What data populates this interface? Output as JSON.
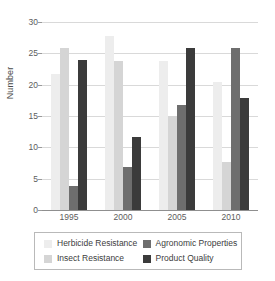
{
  "chart_data": {
    "type": "bar",
    "title": "",
    "subtitle": "",
    "xlabel": "",
    "ylabel": "Number",
    "categories": [
      "1995",
      "2000",
      "2005",
      "2010"
    ],
    "series": [
      {
        "name": "Herbicide Resistance",
        "color": "#ededed",
        "values": [
          21.7,
          27.8,
          23.8,
          20.5
        ]
      },
      {
        "name": "Insect Resistance",
        "color": "#d5d5d5",
        "values": [
          25.8,
          23.8,
          15.0,
          7.7
        ]
      },
      {
        "name": "Agronomic Properties",
        "color": "#6e6e6e",
        "values": [
          3.8,
          6.9,
          16.8,
          25.8
        ]
      },
      {
        "name": "Product Quality",
        "color": "#3b3b3b",
        "values": [
          23.9,
          11.6,
          25.8,
          17.9
        ]
      }
    ],
    "ylim": [
      0,
      30
    ],
    "yticks": [
      0,
      5,
      10,
      15,
      20,
      25,
      30
    ],
    "ytick_labels": [
      "0",
      "5",
      "10",
      "15",
      "20",
      "25",
      "30"
    ],
    "grid": true,
    "legend_position": "bottom",
    "legend_columns": 2
  },
  "legend": {
    "entries": [
      {
        "label": "Herbicide Resistance",
        "color": "#ededed"
      },
      {
        "label": "Agronomic Properties",
        "color": "#6e6e6e"
      },
      {
        "label": "Insect Resistance",
        "color": "#d5d5d5"
      },
      {
        "label": "Product Quality",
        "color": "#3b3b3b"
      }
    ]
  },
  "axes": {
    "y_title": "Number",
    "x_labels": [
      "1995",
      "2000",
      "2005",
      "2010"
    ],
    "y_labels": [
      "30",
      "25",
      "20",
      "15",
      "10",
      "5",
      "0"
    ]
  },
  "colors": {
    "gridline": "#d9d9d9",
    "axis": "#8f8f8f",
    "text": "#4a4a4a",
    "legend_border": "#b9b9b9"
  }
}
